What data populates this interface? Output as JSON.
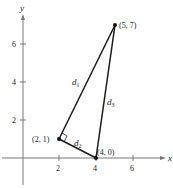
{
  "diagram": {
    "axes": {
      "x_label": "x",
      "y_label": "y",
      "x_ticks": [
        "2",
        "4",
        "6"
      ],
      "y_ticks": [
        "2",
        "4",
        "6"
      ]
    },
    "points": [
      {
        "label": "(5, 7)",
        "x": 5,
        "y": 7
      },
      {
        "label": "(2, 1)",
        "x": 2,
        "y": 1
      },
      {
        "label": "(4, 0)",
        "x": 4,
        "y": 0
      }
    ],
    "segments": [
      {
        "name": "d",
        "sub": "1",
        "from": "(2, 1)",
        "to": "(5, 7)"
      },
      {
        "name": "d",
        "sub": "2",
        "from": "(2, 1)",
        "to": "(4, 0)"
      },
      {
        "name": "d",
        "sub": "3",
        "from": "(4, 0)",
        "to": "(5, 7)"
      }
    ],
    "right_angle_at": "(2, 1)",
    "colors": {
      "axis": "#777777",
      "line": "#1a1a1a",
      "text": "#222222"
    }
  }
}
